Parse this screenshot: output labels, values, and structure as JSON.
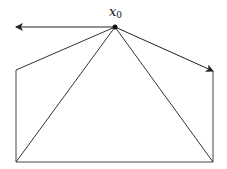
{
  "diagram": {
    "type": "geometric-construction",
    "point_label": {
      "main": "x",
      "subscript": "0"
    },
    "nodes": {
      "x0": {
        "x": 115,
        "y": 27
      },
      "left_arrow_tip": {
        "x": 15,
        "y": 27
      },
      "upper_left": {
        "x": 16,
        "y": 70
      },
      "bottom_left": {
        "x": 16,
        "y": 162
      },
      "bottom_right": {
        "x": 213,
        "y": 162
      },
      "upper_right": {
        "x": 213,
        "y": 71
      }
    },
    "edges": [
      {
        "from": "x0",
        "to": "left_arrow_tip",
        "arrow": true
      },
      {
        "from": "x0",
        "to": "upper_right",
        "arrow": true
      },
      {
        "from": "x0",
        "to": "upper_left",
        "arrow": false
      },
      {
        "from": "x0",
        "to": "bottom_left",
        "arrow": false
      },
      {
        "from": "x0",
        "to": "bottom_right",
        "arrow": false
      },
      {
        "from": "upper_left",
        "to": "bottom_left",
        "arrow": false
      },
      {
        "from": "bottom_left",
        "to": "bottom_right",
        "arrow": false
      },
      {
        "from": "bottom_right",
        "to": "upper_right",
        "arrow": false
      }
    ],
    "colors": {
      "stroke": "#222222",
      "background": "#ffffff"
    }
  }
}
